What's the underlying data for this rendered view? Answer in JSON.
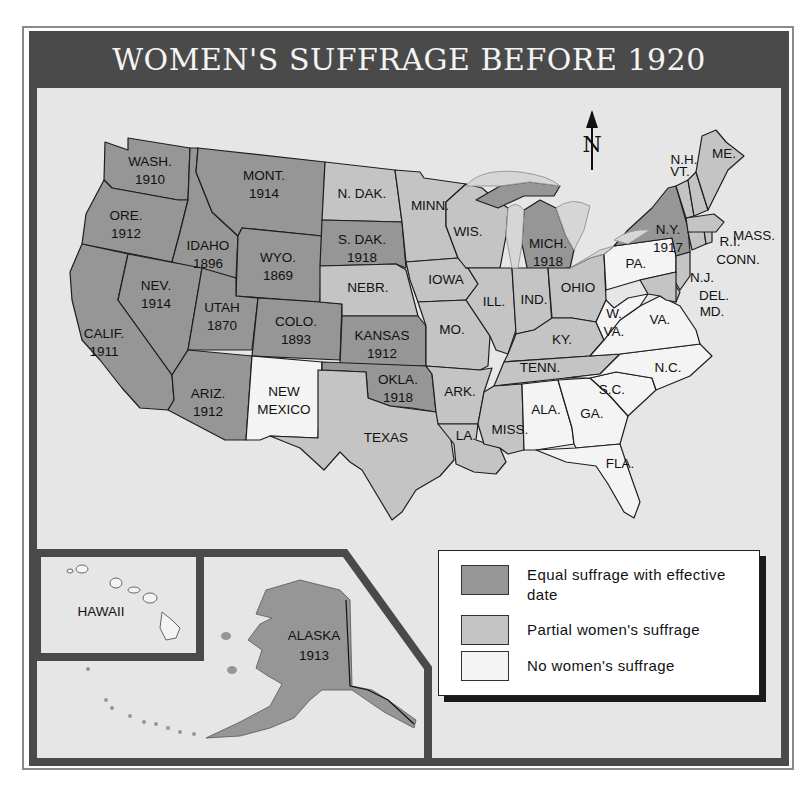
{
  "title": "WOMEN'S SUFFRAGE BEFORE 1920",
  "colors": {
    "equal": "#969696",
    "partial": "#c4c4c4",
    "none": "#f4f4f4",
    "background": "#e6e6e6",
    "frame": "#4a4a4a"
  },
  "compass": {
    "label": "N"
  },
  "legend": {
    "items": [
      {
        "key": "equal",
        "label": "Equal suffrage with effective date"
      },
      {
        "key": "partial",
        "label": "Partial women's suffrage"
      },
      {
        "key": "none",
        "label": "No women's suffrage"
      }
    ]
  },
  "states": [
    {
      "abbr": "WASH.",
      "year": "1910",
      "status": "equal"
    },
    {
      "abbr": "ORE.",
      "year": "1912",
      "status": "equal"
    },
    {
      "abbr": "CALIF.",
      "year": "1911",
      "status": "equal"
    },
    {
      "abbr": "IDAHO",
      "year": "1896",
      "status": "equal"
    },
    {
      "abbr": "NEV.",
      "year": "1914",
      "status": "equal"
    },
    {
      "abbr": "MONT.",
      "year": "1914",
      "status": "equal"
    },
    {
      "abbr": "WYO.",
      "year": "1869",
      "status": "equal"
    },
    {
      "abbr": "UTAH",
      "year": "1870",
      "status": "equal"
    },
    {
      "abbr": "COLO.",
      "year": "1893",
      "status": "equal"
    },
    {
      "abbr": "ARIZ.",
      "year": "1912",
      "status": "equal"
    },
    {
      "abbr": "NEW MEXICO",
      "year": "",
      "status": "none"
    },
    {
      "abbr": "N. DAK.",
      "year": "",
      "status": "partial"
    },
    {
      "abbr": "S. DAK.",
      "year": "1918",
      "status": "equal"
    },
    {
      "abbr": "NEBR.",
      "year": "",
      "status": "partial"
    },
    {
      "abbr": "KANSAS",
      "year": "1912",
      "status": "equal"
    },
    {
      "abbr": "OKLA.",
      "year": "1918",
      "status": "equal"
    },
    {
      "abbr": "TEXAS",
      "year": "",
      "status": "partial"
    },
    {
      "abbr": "MINN.",
      "year": "",
      "status": "partial"
    },
    {
      "abbr": "IOWA",
      "year": "",
      "status": "partial"
    },
    {
      "abbr": "MO.",
      "year": "",
      "status": "partial"
    },
    {
      "abbr": "ARK.",
      "year": "",
      "status": "partial"
    },
    {
      "abbr": "LA.",
      "year": "",
      "status": "partial"
    },
    {
      "abbr": "WIS.",
      "year": "",
      "status": "partial"
    },
    {
      "abbr": "ILL.",
      "year": "",
      "status": "partial"
    },
    {
      "abbr": "MICH.",
      "year": "1918",
      "status": "equal"
    },
    {
      "abbr": "IND.",
      "year": "",
      "status": "partial"
    },
    {
      "abbr": "OHIO",
      "year": "",
      "status": "partial"
    },
    {
      "abbr": "KY.",
      "year": "",
      "status": "partial"
    },
    {
      "abbr": "TENN.",
      "year": "",
      "status": "partial"
    },
    {
      "abbr": "MISS.",
      "year": "",
      "status": "partial"
    },
    {
      "abbr": "ALA.",
      "year": "",
      "status": "none"
    },
    {
      "abbr": "GA.",
      "year": "",
      "status": "none"
    },
    {
      "abbr": "FLA.",
      "year": "",
      "status": "none"
    },
    {
      "abbr": "S.C.",
      "year": "",
      "status": "none"
    },
    {
      "abbr": "N.C.",
      "year": "",
      "status": "none"
    },
    {
      "abbr": "VA.",
      "year": "",
      "status": "none"
    },
    {
      "abbr": "W. VA.",
      "year": "",
      "status": "none"
    },
    {
      "abbr": "PA.",
      "year": "",
      "status": "none"
    },
    {
      "abbr": "N.Y.",
      "year": "1917",
      "status": "equal"
    },
    {
      "abbr": "N.J.",
      "year": "",
      "status": "partial"
    },
    {
      "abbr": "DEL.",
      "year": "",
      "status": "partial"
    },
    {
      "abbr": "MD.",
      "year": "",
      "status": "partial"
    },
    {
      "abbr": "CONN.",
      "year": "",
      "status": "partial"
    },
    {
      "abbr": "R.I.",
      "year": "",
      "status": "partial"
    },
    {
      "abbr": "MASS.",
      "year": "",
      "status": "partial"
    },
    {
      "abbr": "VT.",
      "year": "",
      "status": "partial"
    },
    {
      "abbr": "N.H.",
      "year": "",
      "status": "partial"
    },
    {
      "abbr": "ME.",
      "year": "",
      "status": "partial"
    }
  ],
  "insets": {
    "hawaii": {
      "label": "HAWAII",
      "status": "none"
    },
    "alaska": {
      "label": "ALASKA",
      "year": "1913",
      "status": "equal"
    }
  }
}
